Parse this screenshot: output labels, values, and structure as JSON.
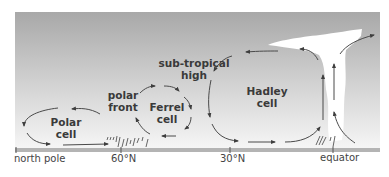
{
  "diagram": {
    "cells": [
      {
        "id": "polar",
        "line1": "Polar",
        "line2": "cell"
      },
      {
        "id": "ferrel",
        "line1": "Ferrel",
        "line2": "cell"
      },
      {
        "id": "hadley",
        "line1": "Hadley",
        "line2": "cell"
      }
    ],
    "features": [
      {
        "id": "polar-front",
        "line1": "polar",
        "line2": "front"
      },
      {
        "id": "subtropical-high",
        "line1": "sub-tropical",
        "line2": "high"
      }
    ],
    "axis": {
      "ticks": [
        {
          "label": "north pole",
          "x": 16
        },
        {
          "label": "60°N",
          "x": 121
        },
        {
          "label": "30°N",
          "x": 230
        },
        {
          "label": "equator",
          "x": 333
        }
      ]
    },
    "colors": {
      "sky_top": "#a9a9a9",
      "sky_bottom": "#f4f4f4",
      "ground": "#b4b4b4",
      "arrow": "#4a4a4a",
      "cloud": "#ffffff",
      "text": "#3a3a3a"
    }
  }
}
